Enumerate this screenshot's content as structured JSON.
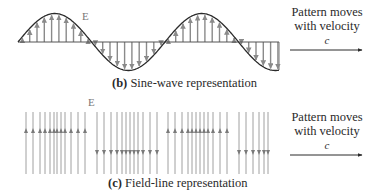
{
  "panel_b": {
    "caption_letter": "(b)",
    "caption_text": " Sine-wave representation",
    "field_label": "E",
    "note_line1": "Pattern moves",
    "note_line2": "with velocity",
    "note_symbol": "c",
    "wave": {
      "x_start": 18,
      "x_end": 279,
      "baseline_y": 42,
      "amplitude": 28.5,
      "period": 147,
      "arrow_spacing": 7.3
    }
  },
  "panel_c": {
    "caption_letter": "(c)",
    "caption_text": " Field-line representation",
    "field_label": "E",
    "note_line1": "Pattern moves",
    "note_line2": "with velocity",
    "note_symbol": "c",
    "lines": {
      "top_y": 112,
      "bottom_y": 174,
      "up_arrow_y": 130,
      "down_arrow_y": 153
    },
    "groups": [
      {
        "direction": "up",
        "x": [
          26,
          33,
          40,
          45,
          50,
          54,
          57,
          61,
          65,
          71,
          78,
          85
        ]
      },
      {
        "direction": "down",
        "x": [
          97,
          104,
          111,
          117,
          122,
          126,
          130,
          134,
          138,
          143,
          150,
          157
        ]
      },
      {
        "direction": "up",
        "x": [
          168,
          175,
          182,
          188,
          192,
          196,
          200,
          204,
          208,
          213,
          220,
          227
        ]
      },
      {
        "direction": "down",
        "x": [
          239,
          246,
          253,
          259,
          264,
          268
        ]
      }
    ]
  },
  "colors": {
    "curve": "#2b2b2b",
    "arrow": "#8a8a8a",
    "text": "#2a2a2a"
  }
}
